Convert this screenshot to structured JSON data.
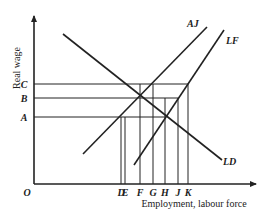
{
  "diagram": {
    "type": "labour-market",
    "y_axis": {
      "title": "Real wage",
      "origin_label": "O"
    },
    "x_axis": {
      "title": "Employment, labour force"
    },
    "wage_levels": [
      {
        "label": "C",
        "y": 84,
        "x_end": 188
      },
      {
        "label": "B",
        "y": 98,
        "x_end": 178
      },
      {
        "label": "A",
        "y": 117,
        "x_end": 166
      }
    ],
    "quantity_marks": [
      {
        "label": "D",
        "x": 121
      },
      {
        "label": "E",
        "x": 125
      },
      {
        "label": "F",
        "x": 140
      },
      {
        "label": "G",
        "x": 153
      },
      {
        "label": "H",
        "x": 165
      },
      {
        "label": "J",
        "x": 178
      },
      {
        "label": "K",
        "x": 188
      }
    ],
    "curves": [
      {
        "label": "LD",
        "x1": 63,
        "y1": 34,
        "x2": 222,
        "y2": 160
      },
      {
        "label": "AJ",
        "x1": 83,
        "y1": 154,
        "x2": 207,
        "y2": 27
      },
      {
        "label": "LF",
        "x1": 134,
        "y1": 165,
        "x2": 224,
        "y2": 30
      }
    ],
    "curve_labels": {
      "LD": "LD",
      "AJ": "AJ",
      "LF": "LF"
    },
    "colors": {
      "line": "#222222",
      "background": "#ffffff"
    }
  }
}
